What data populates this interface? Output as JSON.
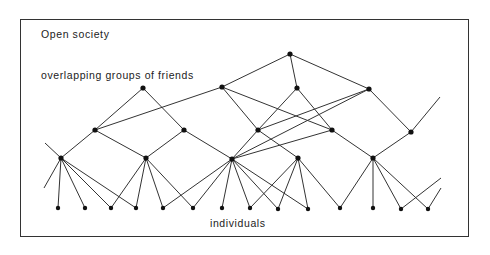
{
  "diagram": {
    "title": "Open society",
    "groups_label": "overlapping groups of friends",
    "individuals_label": "individuals",
    "colors": {
      "line": "#333333",
      "node": "#111111",
      "frame": "#333333"
    },
    "nodes": {
      "T": [
        290,
        54
      ],
      "A": [
        143,
        88
      ],
      "B": [
        222,
        87
      ],
      "C": [
        297,
        88
      ],
      "D": [
        369,
        89
      ],
      "E": [
        95,
        130
      ],
      "F": [
        184,
        130
      ],
      "G": [
        258,
        130
      ],
      "H": [
        332,
        130
      ],
      "I": [
        411,
        132
      ],
      "J": [
        61,
        158
      ],
      "K": [
        146,
        158
      ],
      "L": [
        232,
        159
      ],
      "M": [
        298,
        158
      ],
      "N": [
        373,
        158
      ],
      "i1": [
        58,
        208
      ],
      "i2": [
        85,
        208
      ],
      "i3": [
        111,
        208
      ],
      "i4": [
        136,
        208
      ],
      "i5": [
        163,
        208
      ],
      "i6": [
        193,
        208
      ],
      "i7": [
        222,
        208
      ],
      "i8": [
        250,
        208
      ],
      "i9": [
        278,
        209
      ],
      "i10": [
        308,
        209
      ],
      "i11": [
        340,
        208
      ],
      "i12": [
        373,
        208
      ],
      "i13": [
        401,
        209
      ],
      "i14": [
        428,
        209
      ]
    },
    "edges": [
      [
        "T",
        "B"
      ],
      [
        "T",
        "C"
      ],
      [
        "T",
        "D"
      ],
      [
        "A",
        "E"
      ],
      [
        "A",
        "F"
      ],
      [
        "B",
        "E"
      ],
      [
        "B",
        "G"
      ],
      [
        "B",
        "H"
      ],
      [
        "C",
        "G"
      ],
      [
        "C",
        "H"
      ],
      [
        "D",
        "G"
      ],
      [
        "D",
        "L"
      ],
      [
        "D",
        "I"
      ],
      [
        "E",
        "J"
      ],
      [
        "E",
        "K"
      ],
      [
        "F",
        "K"
      ],
      [
        "F",
        "L"
      ],
      [
        "G",
        "L"
      ],
      [
        "G",
        "M"
      ],
      [
        "H",
        "L"
      ],
      [
        "H",
        "N"
      ],
      [
        "I",
        "N"
      ],
      [
        "J",
        "i1"
      ],
      [
        "J",
        "i2"
      ],
      [
        "J",
        "i3"
      ],
      [
        "J",
        "i4"
      ],
      [
        "K",
        "i3"
      ],
      [
        "K",
        "i4"
      ],
      [
        "K",
        "i5"
      ],
      [
        "K",
        "i6"
      ],
      [
        "L",
        "i5"
      ],
      [
        "L",
        "i6"
      ],
      [
        "L",
        "i7"
      ],
      [
        "L",
        "i8"
      ],
      [
        "L",
        "i9"
      ],
      [
        "L",
        "i10"
      ],
      [
        "M",
        "i8"
      ],
      [
        "M",
        "i9"
      ],
      [
        "M",
        "i10"
      ],
      [
        "M",
        "i11"
      ],
      [
        "N",
        "i11"
      ],
      [
        "N",
        "i12"
      ],
      [
        "N",
        "i13"
      ],
      [
        "N",
        "i14"
      ]
    ],
    "open_lines": [
      [
        [
          61,
          158
        ],
        [
          45,
          143
        ]
      ],
      [
        [
          61,
          158
        ],
        [
          44,
          188
        ]
      ],
      [
        [
          411,
          132
        ],
        [
          440,
          97
        ]
      ],
      [
        [
          401,
          209
        ],
        [
          441,
          178
        ]
      ],
      [
        [
          428,
          209
        ],
        [
          441,
          188
        ]
      ]
    ]
  }
}
